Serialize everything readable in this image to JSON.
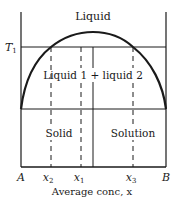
{
  "diagram": {
    "type": "phase-diagram",
    "region_labels": {
      "liquid": "Liquid",
      "two_liquid": "Liquid 1 + liquid 2",
      "solid": "Solid",
      "solution": "Solution"
    },
    "temperature_label": "T",
    "temperature_sub": "1",
    "axis_left_label": "A",
    "axis_right_label": "B",
    "x_ticks": [
      {
        "var": "x",
        "sub": "2"
      },
      {
        "var": "x",
        "sub": "1"
      },
      {
        "var": "x",
        "sub": "3"
      }
    ],
    "x_axis_label": "Average conc, x",
    "colors": {
      "line": "#1a1a1a",
      "background": "#ffffff"
    }
  }
}
